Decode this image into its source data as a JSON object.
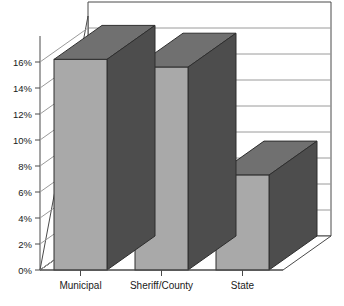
{
  "chart_data": {
    "type": "bar",
    "title": "",
    "subtitle": "",
    "xlabel": "",
    "ylabel": "",
    "categories": [
      "Municipal",
      "Sheriff/County",
      "State"
    ],
    "values": [
      16.2,
      15.6,
      7.3
    ],
    "value_suffix": "%",
    "ylim": [
      0,
      18
    ],
    "yticks": [
      0,
      2,
      4,
      6,
      8,
      10,
      12,
      14,
      16
    ],
    "ytick_labels": [
      "0%",
      "2%",
      "4%",
      "6%",
      "8%",
      "10%",
      "12%",
      "14%",
      "16%"
    ],
    "grid": true,
    "grid_axis": "y",
    "legend": false,
    "legend_position": "none",
    "three_d": true,
    "series": [
      {
        "name": "",
        "values": [
          16.2,
          15.6,
          7.3
        ]
      }
    ],
    "annotations": []
  },
  "style": {
    "bar_front_color": "#a9a9a9",
    "bar_side_color": "#4d4d4d",
    "bar_top_color": "#707070",
    "axis_color": "#4a4a4a",
    "grid_color": "#9a9a9a",
    "wall_color": "#ffffff",
    "background": "#ffffff",
    "text_color": "#1a1a1a"
  },
  "geometry": {
    "origin_x": 40,
    "origin_y": 270,
    "plot_width": 243,
    "plot_height": 234,
    "depth_x": 48,
    "depth_y": -34,
    "bar_width": 53,
    "unit_per_pct": 13.0
  }
}
